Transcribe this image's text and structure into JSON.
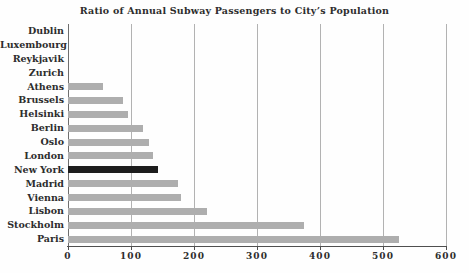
{
  "chart_data": {
    "type": "bar",
    "orientation": "horizontal",
    "title": "Ratio of Annual Subway Passengers to City’s Population",
    "xlabel": "",
    "ylabel": "",
    "categories": [
      "Dublin",
      "Luxembourg",
      "Reykjavik",
      "Zurich",
      "Athens",
      "Brussels",
      "Helsinki",
      "Berlin",
      "Oslo",
      "London",
      "New York",
      "Madrid",
      "Vienna",
      "Lisbon",
      "Stockholm",
      "Paris"
    ],
    "values": [
      0,
      0,
      0,
      0,
      56,
      88,
      95,
      119,
      128,
      135,
      143,
      175,
      180,
      221,
      375,
      525
    ],
    "xlim": [
      0,
      600
    ],
    "x_ticks": [
      0,
      100,
      200,
      300,
      400,
      500,
      600
    ],
    "grid": true,
    "legend": false,
    "highlight_category": "New York",
    "bar_color": "#aeaeae",
    "highlight_color": "#1d1d1d",
    "gridline_color": "#b2b2b2",
    "axis_color": "#4f4f4f",
    "text_color": "#2d2d2d"
  }
}
